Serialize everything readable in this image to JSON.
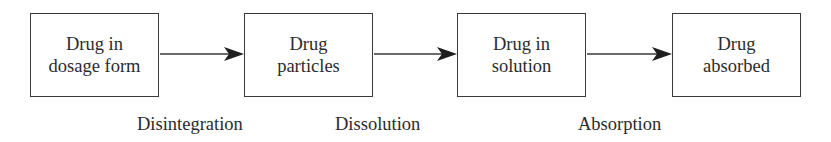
{
  "diagram": {
    "type": "flow",
    "direction": "left-to-right",
    "colors": {
      "stroke": "#3a3a3a",
      "text": "#2b2b2b",
      "background": "#ffffff"
    },
    "nodes": [
      {
        "id": "dosage-form",
        "lines": [
          "Drug in",
          "dosage form"
        ]
      },
      {
        "id": "particles",
        "lines": [
          "Drug",
          "particles"
        ]
      },
      {
        "id": "solution",
        "lines": [
          "Drug in",
          "solution"
        ]
      },
      {
        "id": "absorbed",
        "lines": [
          "Drug",
          "absorbed"
        ]
      }
    ],
    "edges": [
      {
        "from": "dosage-form",
        "to": "particles",
        "label": "Disintegration"
      },
      {
        "from": "particles",
        "to": "solution",
        "label": "Dissolution"
      },
      {
        "from": "solution",
        "to": "absorbed",
        "label": "Absorption"
      }
    ]
  }
}
